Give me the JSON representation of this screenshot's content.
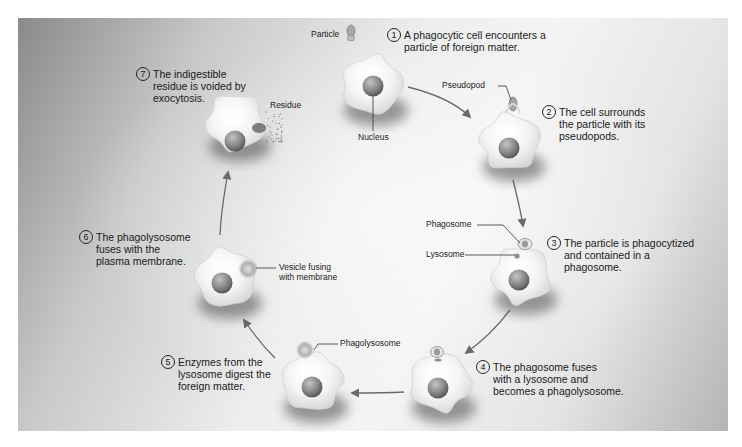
{
  "colors": {
    "cell_fill": "#f7f7f5",
    "cell_shadow": "#6e6e6e",
    "nucleus": "#8a8a8a",
    "arrow": "#6a6a6a",
    "text": "#1a1a1a"
  },
  "steps": [
    {
      "number": "1",
      "text": "A phagocytic cell encounters a\nparticle of foreign matter."
    },
    {
      "number": "2",
      "text": "The cell surrounds\nthe particle with its\npseudopods."
    },
    {
      "number": "3",
      "text": "The particle is phagocytized\nand contained in a\nphagosome."
    },
    {
      "number": "4",
      "text": "The phagosome fuses\nwith a lysosome and\nbecomes a phagolysosome."
    },
    {
      "number": "5",
      "text": "Enzymes from the\nlysosome digest the\nforeign matter."
    },
    {
      "number": "6",
      "text": "The phagolysosome\nfuses with the\nplasma membrane."
    },
    {
      "number": "7",
      "text": "The indigestible\nresidue is voided by\nexocytosis."
    }
  ],
  "labels": {
    "particle": "Particle",
    "nucleus": "Nucleus",
    "pseudopod": "Pseudopod",
    "phagosome": "Phagosome",
    "lysosome": "Lysosome",
    "phagolysosome": "Phagolysosome",
    "vesicle": "Vesicle fusing\nwith membrane",
    "residue": "Residue"
  },
  "cycle_order": [
    "1",
    "2",
    "3",
    "4",
    "5",
    "6",
    "7"
  ]
}
